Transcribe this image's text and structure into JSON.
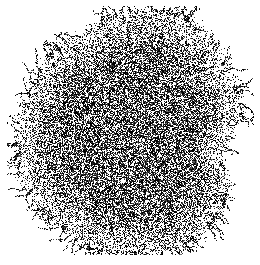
{
  "figure": {
    "name": "fractal-aggregate-cluster",
    "kind": "scientific-figure",
    "canvas": {
      "width": 260,
      "height": 265,
      "background_color": "#ffffff"
    },
    "frame": {
      "left": 5,
      "top": 5,
      "width": 250,
      "height": 251,
      "line_color": "#b3b3b3",
      "line_width": 1,
      "fill_color": "#ffffff"
    }
  },
  "chart_data": {
    "type": "scatter",
    "title": "",
    "subtitle": "",
    "xlabel": "",
    "ylabel": "",
    "grid": false,
    "legend": null,
    "axis_ticks": [],
    "tick_labels": [],
    "annotations": [],
    "xlim": [
      5,
      255
    ],
    "ylim": [
      5,
      256
    ],
    "cluster": {
      "shape": "disk-with-fractal-boundary",
      "center_x": 130,
      "center_y": 134,
      "radius_x": 117,
      "radius_y": 119,
      "extent_left": 13,
      "extent_right": 246,
      "extent_top": 15,
      "extent_bottom": 253,
      "core_fill_density": 0.62,
      "edge_fill_density": 0.18,
      "core_radius_fraction": 0.62,
      "boundary_roughness": 0.17,
      "boundary_lobes": 9,
      "dendrite_length": 14,
      "dendrite_count": 150,
      "point_size": 1,
      "point_colors": [
        "#000000",
        "#1c1c1c",
        "#3a3a3a",
        "#555555",
        "#707070"
      ],
      "color_weights": [
        0.46,
        0.2,
        0.15,
        0.12,
        0.07
      ],
      "estimated_point_count": 26000,
      "random_seed": 20240517
    }
  },
  "accessibility": {
    "alt_text": "A dense, roughly circular fractal aggregate of black pixels with a rough dendritic boundary, centered inside a thin gray square frame on a white background."
  }
}
